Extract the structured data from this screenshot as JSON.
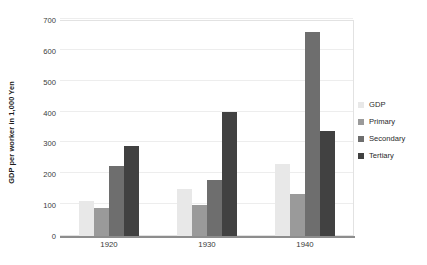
{
  "chart_data": {
    "type": "bar",
    "title": "",
    "xlabel": "",
    "ylabel": "GDP per worker in 1,000 Yen",
    "categories": [
      "1920",
      "1930",
      "1940"
    ],
    "series": [
      {
        "name": "GDP",
        "values": [
          115,
          152,
          232
        ],
        "color": "#e8e8e8"
      },
      {
        "name": "Primary",
        "values": [
          90,
          100,
          135
        ],
        "color": "#9a9a9a"
      },
      {
        "name": "Secondary",
        "values": [
          228,
          180,
          660
        ],
        "color": "#6e6e6e"
      },
      {
        "name": "Tertiary",
        "values": [
          293,
          402,
          340
        ],
        "color": "#414141"
      }
    ],
    "ylim": [
      0,
      700
    ],
    "yticks": [
      0,
      100,
      200,
      300,
      400,
      500,
      600,
      700
    ],
    "ytick_labels": [
      "0",
      "100",
      "200",
      "300",
      "400",
      "500",
      "600",
      "700"
    ],
    "grid": true,
    "grid_axis": "y",
    "legend_position": "right",
    "background_color": "#ffffff",
    "gridline_color": "#ededed",
    "axis_color": "#8d8d8d"
  },
  "legend": {
    "items": [
      {
        "label": "GDP"
      },
      {
        "label": "Primary"
      },
      {
        "label": "Secondary"
      },
      {
        "label": "Tertiary"
      }
    ]
  }
}
